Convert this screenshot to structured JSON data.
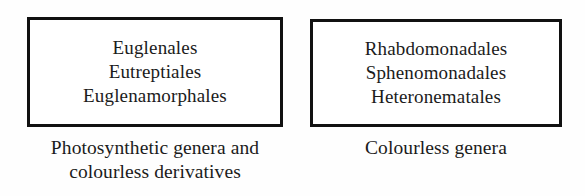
{
  "figure": {
    "background_color": "#fefefe",
    "border_color": "#111111",
    "text_color": "#1b1b1b"
  },
  "groups": [
    {
      "id": "photosynthetic",
      "box": {
        "orders": [
          "Euglenales",
          "Eutreptiales",
          "Euglenamorphales"
        ]
      },
      "caption": {
        "lines": [
          "Photosynthetic genera and",
          "colourless derivatives"
        ]
      }
    },
    {
      "id": "colourless",
      "box": {
        "orders": [
          "Rhabdomonadales",
          "Sphenomonadales",
          "Heteronematales"
        ]
      },
      "caption": {
        "lines": [
          "Colourless genera"
        ]
      }
    }
  ]
}
